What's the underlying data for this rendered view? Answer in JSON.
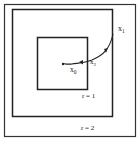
{
  "diagram": {
    "regions": [
      {
        "id": "outer-frame",
        "label": ""
      },
      {
        "id": "r2-box",
        "label": "r = 2"
      },
      {
        "id": "r1-box",
        "label": "r = 1"
      }
    ],
    "points": {
      "x1": {
        "label": "x",
        "sub": "1"
      },
      "x0": {
        "label": "x",
        "sub": "0"
      },
      "x2": {
        "label": "x",
        "sub": "2"
      }
    },
    "stroke_color": "#222222",
    "background": "#ffffff"
  }
}
